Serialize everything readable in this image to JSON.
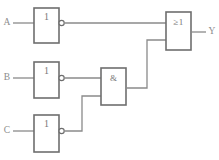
{
  "diagram": {
    "type": "logic-circuit",
    "title": "",
    "background_color": "#ffffff",
    "line_color": "#8a8a8a",
    "box_stroke_color": "#6e6e6e",
    "text_color": "#8d8d8d",
    "inputs": [
      {
        "id": "A",
        "label": "A"
      },
      {
        "id": "B",
        "label": "B"
      },
      {
        "id": "C",
        "label": "C"
      }
    ],
    "outputs": [
      {
        "id": "Y",
        "label": "Y"
      }
    ],
    "gates": [
      {
        "id": "not-a",
        "symbol": "1",
        "kind": "not",
        "inverted_output": true,
        "x": 34,
        "y": 8,
        "w": 25,
        "h": 35
      },
      {
        "id": "not-b",
        "symbol": "1",
        "kind": "not",
        "inverted_output": true,
        "x": 34,
        "y": 62,
        "w": 25,
        "h": 36
      },
      {
        "id": "not-c",
        "symbol": "1",
        "kind": "not",
        "inverted_output": true,
        "x": 34,
        "y": 115,
        "w": 25,
        "h": 37
      },
      {
        "id": "and-1",
        "symbol": "&",
        "kind": "and",
        "inverted_output": false,
        "x": 101,
        "y": 68,
        "w": 25,
        "h": 37
      },
      {
        "id": "or-1",
        "symbol": "≥1",
        "kind": "or",
        "inverted_output": false,
        "x": 166,
        "y": 12,
        "w": 25,
        "h": 38
      }
    ]
  }
}
